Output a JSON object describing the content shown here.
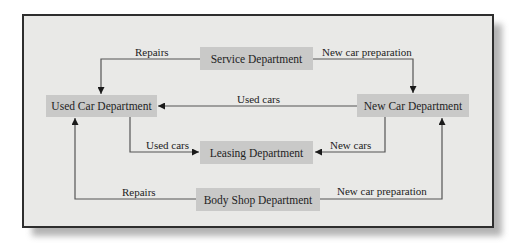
{
  "diagram": {
    "type": "flow",
    "nodes": [
      {
        "id": "service",
        "label": "Service Department"
      },
      {
        "id": "used_car",
        "label": "Used Car Department"
      },
      {
        "id": "new_car",
        "label": "New Car Department"
      },
      {
        "id": "leasing",
        "label": "Leasing Department"
      },
      {
        "id": "body_shop",
        "label": "Body Shop Department"
      }
    ],
    "edges": [
      {
        "from": "service",
        "to": "used_car",
        "label": "Repairs"
      },
      {
        "from": "service",
        "to": "new_car",
        "label": "New car preparation"
      },
      {
        "from": "new_car",
        "to": "used_car",
        "label": "Used cars"
      },
      {
        "from": "used_car",
        "to": "leasing",
        "label": "Used cars"
      },
      {
        "from": "new_car",
        "to": "leasing",
        "label": "New cars"
      },
      {
        "from": "body_shop",
        "to": "used_car",
        "label": "Repairs"
      },
      {
        "from": "body_shop",
        "to": "new_car",
        "label": "New car preparation"
      }
    ]
  },
  "colors": {
    "frame_bg": "#e9e9e7",
    "frame_border": "#2e2e2e",
    "node_fill": "#c9c9c8",
    "line": "#555555"
  }
}
